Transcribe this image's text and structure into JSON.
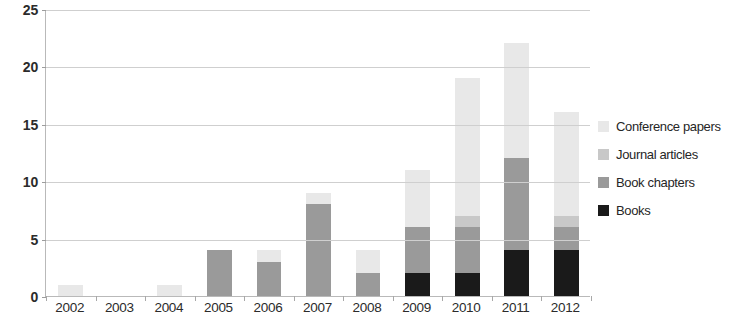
{
  "chart_data": {
    "type": "bar",
    "subtype": "stacked-bar",
    "title": "",
    "xlabel": "",
    "ylabel": "",
    "categories": [
      "2002",
      "2003",
      "2004",
      "2005",
      "2006",
      "2007",
      "2008",
      "2009",
      "2010",
      "2011",
      "2012"
    ],
    "ylim": [
      0,
      25
    ],
    "yticks": [
      0,
      5,
      10,
      15,
      20,
      25
    ],
    "ytick_labels": [
      "0",
      "5",
      "10",
      "15",
      "20",
      "25"
    ],
    "grid": true,
    "legend_position": "right",
    "series": [
      {
        "name": "Books",
        "color": "#1a1a1a",
        "values": [
          0,
          0,
          0,
          0,
          0,
          0,
          0,
          2,
          2,
          4,
          4
        ]
      },
      {
        "name": "Book chapters",
        "color": "#9a9a9a",
        "values": [
          0,
          0,
          0,
          4,
          3,
          8,
          2,
          4,
          4,
          8,
          2
        ]
      },
      {
        "name": "Journal articles",
        "color": "#c8c8c8",
        "values": [
          0,
          0,
          0,
          0,
          0,
          0,
          0,
          0,
          1,
          0,
          1
        ]
      },
      {
        "name": "Conference papers",
        "color": "#e8e8e8",
        "values": [
          1,
          0,
          1,
          0,
          1,
          1,
          2,
          5,
          12,
          10,
          9
        ]
      }
    ],
    "totals": [
      1,
      0,
      1,
      4,
      4,
      9,
      4,
      11,
      19,
      22,
      16
    ]
  },
  "legend": {
    "items": [
      {
        "label": "Conference papers",
        "color": "#e8e8e8"
      },
      {
        "label": "Journal articles",
        "color": "#c8c8c8"
      },
      {
        "label": "Book chapters",
        "color": "#9a9a9a"
      },
      {
        "label": "Books",
        "color": "#1a1a1a"
      }
    ]
  },
  "axes": {
    "y_ticks": [
      "0",
      "5",
      "10",
      "15",
      "20",
      "25"
    ],
    "x_ticks": [
      "2002",
      "2003",
      "2004",
      "2005",
      "2006",
      "2007",
      "2008",
      "2009",
      "2010",
      "2011",
      "2012"
    ]
  },
  "colors": {
    "gridline": "#cfcfcf",
    "axis": "#b9b9b9",
    "text": "#262626",
    "background": "#ffffff"
  }
}
